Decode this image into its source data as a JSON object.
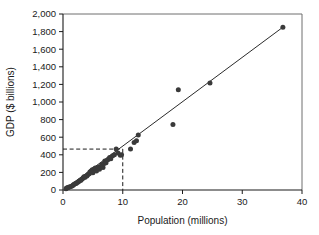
{
  "chart_data": {
    "type": "scatter",
    "title": "",
    "xlabel": "Population (millions)",
    "ylabel": "GDP ($ billions)",
    "xlim": [
      0,
      40
    ],
    "ylim": [
      0,
      2000
    ],
    "xticks": [
      0,
      10,
      20,
      30,
      40
    ],
    "yticks": [
      0,
      200,
      400,
      600,
      800,
      1000,
      1200,
      1400,
      1600,
      1800,
      2000
    ],
    "xtick_labels": [
      "0",
      "10",
      "20",
      "30",
      "40"
    ],
    "ytick_labels": [
      "0",
      "200",
      "400",
      "600",
      "800",
      "1,000",
      "1,200",
      "1,400",
      "1,600",
      "1,800",
      "2,000"
    ],
    "grid": false,
    "legend": null,
    "point_color": "#3a3a3a",
    "line_color": "#2b2b2b",
    "points": [
      {
        "x": 0.5,
        "y": 15
      },
      {
        "x": 0.6,
        "y": 22
      },
      {
        "x": 0.8,
        "y": 26
      },
      {
        "x": 0.9,
        "y": 30
      },
      {
        "x": 1.1,
        "y": 35
      },
      {
        "x": 1.3,
        "y": 40
      },
      {
        "x": 1.5,
        "y": 45
      },
      {
        "x": 1.7,
        "y": 55
      },
      {
        "x": 1.8,
        "y": 62
      },
      {
        "x": 2.0,
        "y": 70
      },
      {
        "x": 2.2,
        "y": 75
      },
      {
        "x": 2.4,
        "y": 85
      },
      {
        "x": 2.6,
        "y": 95
      },
      {
        "x": 2.8,
        "y": 105
      },
      {
        "x": 3.0,
        "y": 110
      },
      {
        "x": 3.2,
        "y": 125
      },
      {
        "x": 3.4,
        "y": 135
      },
      {
        "x": 3.5,
        "y": 150
      },
      {
        "x": 3.7,
        "y": 145
      },
      {
        "x": 4.0,
        "y": 160
      },
      {
        "x": 4.2,
        "y": 175
      },
      {
        "x": 4.4,
        "y": 185
      },
      {
        "x": 4.5,
        "y": 205
      },
      {
        "x": 4.7,
        "y": 215
      },
      {
        "x": 4.9,
        "y": 230
      },
      {
        "x": 5.0,
        "y": 195
      },
      {
        "x": 5.2,
        "y": 240
      },
      {
        "x": 5.4,
        "y": 250
      },
      {
        "x": 5.6,
        "y": 215
      },
      {
        "x": 5.8,
        "y": 245
      },
      {
        "x": 6.0,
        "y": 260
      },
      {
        "x": 6.1,
        "y": 235
      },
      {
        "x": 6.3,
        "y": 265
      },
      {
        "x": 6.5,
        "y": 290
      },
      {
        "x": 6.7,
        "y": 255
      },
      {
        "x": 6.9,
        "y": 300
      },
      {
        "x": 7.0,
        "y": 330
      },
      {
        "x": 7.2,
        "y": 310
      },
      {
        "x": 7.5,
        "y": 345
      },
      {
        "x": 7.8,
        "y": 370
      },
      {
        "x": 8.0,
        "y": 355
      },
      {
        "x": 8.3,
        "y": 390
      },
      {
        "x": 8.6,
        "y": 400
      },
      {
        "x": 8.9,
        "y": 465
      },
      {
        "x": 9.2,
        "y": 420
      },
      {
        "x": 9.6,
        "y": 395
      },
      {
        "x": 9.8,
        "y": 400
      },
      {
        "x": 11.3,
        "y": 465
      },
      {
        "x": 11.9,
        "y": 540
      },
      {
        "x": 12.3,
        "y": 560
      },
      {
        "x": 12.6,
        "y": 625
      },
      {
        "x": 18.4,
        "y": 745
      },
      {
        "x": 19.3,
        "y": 1140
      },
      {
        "x": 24.6,
        "y": 1215
      },
      {
        "x": 36.8,
        "y": 1850
      }
    ],
    "fit_line": {
      "x0": 0.3,
      "y0": 10,
      "x1": 36.9,
      "y1": 1855
    },
    "reference_lines": {
      "x_value": 10,
      "y_value": 465,
      "style": "dashed"
    }
  }
}
